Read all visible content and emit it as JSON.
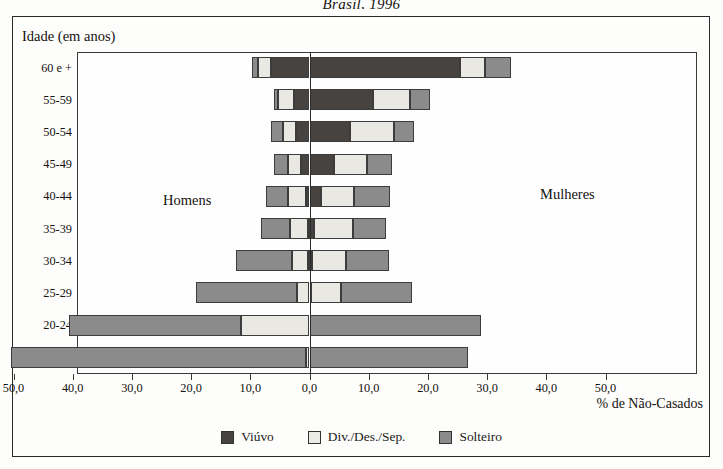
{
  "title": "Brasil, 1996",
  "axis_y_title": "Idade (em anos)",
  "axis_x_title": "% de Não-Casados",
  "side_labels": {
    "left": "Homens",
    "right": "Mulheres"
  },
  "legend": [
    {
      "key": "viuvo",
      "label": "Viúvo",
      "color": "#474341"
    },
    {
      "key": "div",
      "label": "Div./Des./Sep.",
      "color": "#ececE6"
    },
    {
      "key": "solteiro",
      "label": "Solteiro",
      "color": "#8b8b8b"
    }
  ],
  "xticks": [
    "50,0",
    "40,0",
    "30,0",
    "20,0",
    "10,0",
    "0,0",
    "10,0",
    "20,0",
    "30,0",
    "40,0",
    "50,0"
  ],
  "chart_data": {
    "type": "bar",
    "subtype": "population-pyramid-stacked",
    "title": "Brasil, 1996",
    "xlabel": "% de Não-Casados",
    "ylabel": "Idade (em anos)",
    "xlim": [
      -50,
      50
    ],
    "xtick_values": [
      -50,
      -40,
      -30,
      -20,
      -10,
      0,
      10,
      20,
      30,
      40,
      50
    ],
    "xtick_labels": [
      "50,0",
      "40,0",
      "30,0",
      "20,0",
      "10,0",
      "0,0",
      "10,0",
      "20,0",
      "30,0",
      "40,0",
      "50,0"
    ],
    "grid": false,
    "legend_position": "bottom",
    "categories": [
      "60 e +",
      "55-59",
      "50-54",
      "45-49",
      "40-44",
      "35-39",
      "30-34",
      "25-29",
      "20-24",
      "15-19"
    ],
    "groups": [
      "Homens",
      "Mulheres"
    ],
    "series": [
      {
        "name": "Viúvo",
        "side": "Homens",
        "values": [
          6.5,
          2.6,
          2.3,
          1.5,
          0.6,
          0.3,
          0.2,
          0.1,
          0.1,
          0.1
        ]
      },
      {
        "name": "Div./Des./Sep.",
        "side": "Homens",
        "values": [
          2.2,
          2.8,
          2.2,
          2.2,
          3.0,
          3.0,
          2.8,
          2.0,
          11.5,
          0.5
        ]
      },
      {
        "name": "Solteiro",
        "side": "Homens",
        "values": [
          1.0,
          0.6,
          2.0,
          2.3,
          3.7,
          4.9,
          9.4,
          17.1,
          29.0,
          49.8
        ]
      },
      {
        "name": "Viúvo",
        "side": "Mulheres",
        "values": [
          25.4,
          10.7,
          6.9,
          4.2,
          2.0,
          0.8,
          0.4,
          0.2,
          0.1,
          0.1
        ]
      },
      {
        "name": "Div./Des./Sep.",
        "side": "Mulheres",
        "values": [
          4.3,
          6.2,
          7.3,
          5.5,
          5.6,
          6.6,
          5.7,
          5.2,
          0.0,
          0.0
        ]
      },
      {
        "name": "Solteiro",
        "side": "Mulheres",
        "values": [
          4.3,
          3.4,
          3.4,
          4.2,
          6.0,
          5.6,
          7.4,
          11.9,
          28.9,
          26.6
        ]
      }
    ],
    "rows": [
      {
        "category": "60 e +",
        "left": {
          "viuvo": 6.5,
          "div": 2.2,
          "solteiro": 1.0,
          "total": 9.7
        },
        "right": {
          "viuvo": 25.4,
          "div": 4.3,
          "solteiro": 4.3,
          "total": 34.0
        }
      },
      {
        "category": "55-59",
        "left": {
          "viuvo": 2.6,
          "div": 2.8,
          "solteiro": 0.6,
          "total": 6.0
        },
        "right": {
          "viuvo": 10.7,
          "div": 6.2,
          "solteiro": 3.4,
          "total": 20.3
        }
      },
      {
        "category": "50-54",
        "left": {
          "viuvo": 2.3,
          "div": 2.2,
          "solteiro": 2.0,
          "total": 6.5
        },
        "right": {
          "viuvo": 6.9,
          "div": 7.3,
          "solteiro": 3.4,
          "total": 17.6
        }
      },
      {
        "category": "45-49",
        "left": {
          "viuvo": 1.5,
          "div": 2.2,
          "solteiro": 2.3,
          "total": 6.0
        },
        "right": {
          "viuvo": 4.2,
          "div": 5.5,
          "solteiro": 4.2,
          "total": 13.9
        }
      },
      {
        "category": "40-44",
        "left": {
          "viuvo": 0.6,
          "div": 3.0,
          "solteiro": 3.7,
          "total": 7.3
        },
        "right": {
          "viuvo": 2.0,
          "div": 5.6,
          "solteiro": 6.0,
          "total": 13.6
        }
      },
      {
        "category": "35-39",
        "left": {
          "viuvo": 0.3,
          "div": 3.0,
          "solteiro": 4.9,
          "total": 8.2
        },
        "right": {
          "viuvo": 0.8,
          "div": 6.6,
          "solteiro": 5.6,
          "total": 13.0
        }
      },
      {
        "category": "30-34",
        "left": {
          "viuvo": 0.2,
          "div": 2.8,
          "solteiro": 9.4,
          "total": 12.4
        },
        "right": {
          "viuvo": 0.4,
          "div": 5.7,
          "solteiro": 7.4,
          "total": 13.5
        }
      },
      {
        "category": "25-29",
        "left": {
          "viuvo": 0.1,
          "div": 2.0,
          "solteiro": 17.1,
          "total": 19.2
        },
        "right": {
          "viuvo": 0.2,
          "div": 5.2,
          "solteiro": 11.9,
          "total": 17.3
        }
      },
      {
        "category": "20-24",
        "left": {
          "viuvo": 0.1,
          "div": 11.5,
          "solteiro": 29.0,
          "total": 40.6
        },
        "right": {
          "viuvo": 0.1,
          "div": 0.0,
          "solteiro": 28.9,
          "total": 29.0
        }
      },
      {
        "category": "15-19",
        "left": {
          "viuvo": 0.1,
          "div": 0.5,
          "solteiro": 49.8,
          "total": 50.4
        },
        "right": {
          "viuvo": 0.1,
          "div": 0.0,
          "solteiro": 26.6,
          "total": 26.7
        }
      }
    ]
  }
}
